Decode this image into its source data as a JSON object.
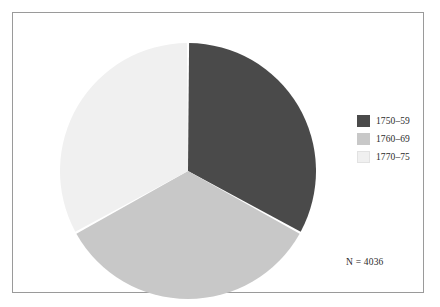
{
  "figure": {
    "frame_border_color": "#9a9a9a",
    "background": "#ffffff",
    "annotation": "N = 4036"
  },
  "legend": {
    "position": "right",
    "items": [
      {
        "label": "1750–59",
        "color": "#4a4a4a"
      },
      {
        "label": "1760–69",
        "color": "#c8c8c8"
      },
      {
        "label": "1770–75",
        "color": "#f0f0f0"
      }
    ]
  },
  "chart_data": {
    "type": "pie",
    "title": "",
    "subtitle": "",
    "xlabel": "",
    "ylabel": "",
    "categories": [
      "1750–59",
      "1760–69",
      "1770–75"
    ],
    "values": [
      33.0,
      34.0,
      33.0
    ],
    "unit": "percent",
    "total_n": 4036,
    "annotations": [
      "N = 4036"
    ],
    "legend_position": "right",
    "grid": false,
    "slice_colors": [
      "#4a4a4a",
      "#c8c8c8",
      "#f0f0f0"
    ],
    "start_angle_deg": 0,
    "direction": "clockwise",
    "separator_color": "#ffffff",
    "geometry": {
      "center_x": 130,
      "center_y": 130,
      "radius": 128,
      "gap_px": 2.2
    }
  }
}
